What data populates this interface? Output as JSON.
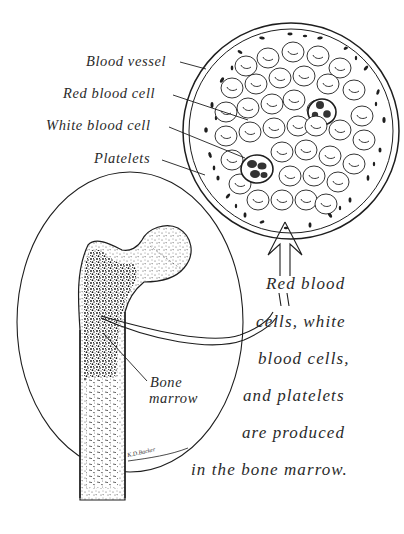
{
  "figure": {
    "type": "anatomical illustration"
  },
  "labels": {
    "blood_vessel": "Blood vessel",
    "red_blood_cell": "Red blood cell",
    "white_blood_cell": "White blood cell",
    "platelets": "Platelets",
    "bone_marrow_line1": "Bone",
    "bone_marrow_line2": "marrow"
  },
  "caption": {
    "lines": [
      "Red blood",
      "cells, white",
      "blood cells,",
      "and platelets",
      "are produced",
      "in the bone marrow."
    ]
  },
  "signature": "K.D.Backer",
  "colors": {
    "ink": "#1e1e1e",
    "background": "#ffffff",
    "text": "#2a2a2a"
  }
}
